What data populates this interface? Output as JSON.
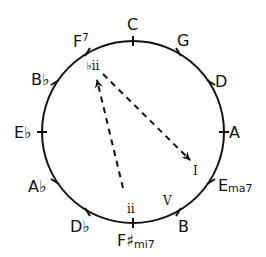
{
  "diagram": {
    "type": "circle-of-fifths",
    "stroke_color": "#111111",
    "notes": [
      {
        "name": "C",
        "label": "C",
        "suffix": ""
      },
      {
        "name": "G",
        "label": "G",
        "suffix": ""
      },
      {
        "name": "D",
        "label": "D",
        "suffix": ""
      },
      {
        "name": "A",
        "label": "A",
        "suffix": ""
      },
      {
        "name": "E",
        "label": "E",
        "suffix": "ma7"
      },
      {
        "name": "B",
        "label": "B",
        "suffix": ""
      },
      {
        "name": "F#",
        "label": "F♯",
        "suffix": "mi7"
      },
      {
        "name": "Db",
        "label": "D♭",
        "suffix": ""
      },
      {
        "name": "Ab",
        "label": "A♭",
        "suffix": ""
      },
      {
        "name": "Eb",
        "label": "E♭",
        "suffix": ""
      },
      {
        "name": "Bb",
        "label": "B♭",
        "suffix": ""
      },
      {
        "name": "F",
        "label": "F",
        "suffix": "7"
      }
    ],
    "roman_numerals": {
      "flat_two": "♭ii",
      "one": "I",
      "five": "V",
      "two": "ii"
    },
    "arrows": [
      {
        "from": "ii",
        "to": "♭ii",
        "style": "dashed"
      },
      {
        "from": "♭ii",
        "to": "I",
        "style": "dashed"
      }
    ]
  }
}
